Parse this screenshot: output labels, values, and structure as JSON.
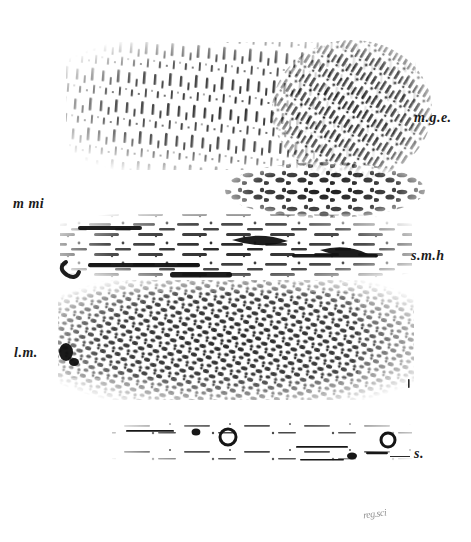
{
  "figure": {
    "kind": "histological-micrograph",
    "background_color": "#ffffff",
    "ink_color": "#1b1b1b",
    "width_px": 471,
    "height_px": 542
  },
  "labels": [
    {
      "id": "mge",
      "text": "m.g.e.",
      "x": 414,
      "y": 110,
      "size": "md",
      "meaning": "mucous-gland-epithelium",
      "leader": false
    },
    {
      "id": "mmi",
      "text": "m mi",
      "x": 13,
      "y": 196,
      "size": "md",
      "meaning": "muscularis-mucosae-internal",
      "leader": false
    },
    {
      "id": "smh",
      "text": "s.m.h",
      "x": 411,
      "y": 248,
      "size": "md",
      "meaning": "submucosa",
      "leader": false
    },
    {
      "id": "lm",
      "text": "l.m.",
      "x": 14,
      "y": 345,
      "size": "md",
      "meaning": "longitudinal-muscle",
      "leader": false
    },
    {
      "id": "s",
      "text": "s.",
      "x": 414,
      "y": 446,
      "size": "md",
      "meaning": "serosa",
      "leader": true
    }
  ],
  "leaders": [
    {
      "id": "s-leader",
      "x": 390,
      "y": 456,
      "width": 20
    }
  ],
  "bands": [
    {
      "id": "mucous-gland-epithelium",
      "top": 45,
      "height": 120,
      "left": 70,
      "width": 340,
      "texture": "sparse-vertical-dashes"
    },
    {
      "id": "muscularis-mucosae",
      "top": 165,
      "height": 45,
      "left": 230,
      "width": 180,
      "texture": "dark-blobs"
    },
    {
      "id": "submucosa",
      "top": 215,
      "height": 65,
      "left": 62,
      "width": 348,
      "texture": "horizontal-streaks"
    },
    {
      "id": "longitudinal-muscle",
      "top": 282,
      "height": 115,
      "left": 60,
      "width": 352,
      "texture": "dense-mottled"
    },
    {
      "id": "serosa",
      "top": 420,
      "height": 45,
      "left": 115,
      "width": 295,
      "texture": "thin-scattered-rings"
    }
  ],
  "stamp": {
    "text": "reg.sci",
    "x": 363,
    "y": 508
  }
}
